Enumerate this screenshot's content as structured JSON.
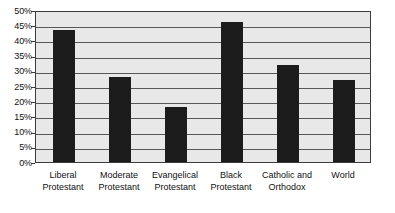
{
  "chart_data": {
    "type": "bar",
    "title": "",
    "subtitle": "",
    "xlabel": "",
    "ylabel": "",
    "ylim": [
      0,
      50
    ],
    "ytick_step": 5,
    "ytick_labels": [
      "50%",
      "45%",
      "40%",
      "35%",
      "30%",
      "25%",
      "20%",
      "15%",
      "10%",
      "5%",
      "0%"
    ],
    "ytick_values": [
      50,
      45,
      40,
      35,
      30,
      25,
      20,
      15,
      10,
      5,
      0
    ],
    "grid": true,
    "legend": false,
    "legend_position": "none",
    "value_format": "percent",
    "categories": [
      "Liberal Protestant",
      "Moderate Protestant",
      "Evangelical Protestant",
      "Black Protestant",
      "Catholic and Orthodox",
      "World"
    ],
    "category_lines": [
      [
        "Liberal",
        "Protestant"
      ],
      [
        "Moderate",
        "Protestant"
      ],
      [
        "Evangelical",
        "Protestant"
      ],
      [
        "Black",
        "Protestant"
      ],
      [
        "Catholic and",
        "Orthodox"
      ],
      [
        "World",
        ""
      ]
    ],
    "values": [
      43.5,
      28,
      18,
      46,
      32,
      27
    ],
    "series": [
      {
        "name": "",
        "values": [
          43.5,
          28,
          18,
          46,
          32,
          27
        ]
      }
    ]
  },
  "style": {
    "bar_color": "#1c1c1c",
    "plot_background": "#e8e8e8",
    "gridline_color": "#585858",
    "axis_color": "#3c3c3c",
    "text_color": "#111111",
    "page_background": "#ffffff"
  }
}
